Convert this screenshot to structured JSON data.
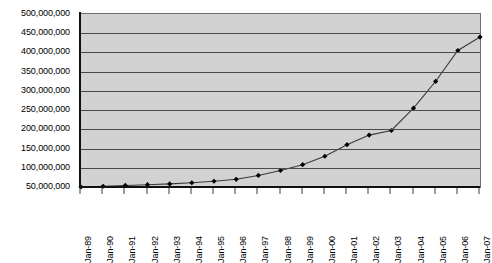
{
  "chart_data": {
    "type": "line",
    "title": "",
    "subtitle": "",
    "xlabel": "",
    "ylabel": "",
    "grid": true,
    "legend": false,
    "legend_position": "none",
    "marker": "diamond",
    "marker_color": "#000000",
    "line_color": "#3a3a3a",
    "plot_background": "#d2d2d2",
    "gridline_color": "#4a4a4a",
    "axis_color": "#111111",
    "ylim": [
      0,
      500000000
    ],
    "y_axis_start": 50000000,
    "ytick_step": 50000000,
    "ytick_labels": [
      "500,000,000",
      "450,000,000",
      "400,000,000",
      "350,000,000",
      "300,000,000",
      "250,000,000",
      "200,000,000",
      "150,000,000",
      "100,000,000",
      "50,000,000"
    ],
    "ytick_values": [
      500000000,
      450000000,
      400000000,
      350000000,
      300000000,
      250000000,
      200000000,
      150000000,
      100000000,
      50000000
    ],
    "categories": [
      "Jan-89",
      "Jan-90",
      "Jan-91",
      "Jan-92",
      "Jan-93",
      "Jan-94",
      "Jan-95",
      "Jan-96",
      "Jan-97",
      "Jan-98",
      "Jan-99",
      "Jan-00",
      "Jan-01",
      "Jan-02",
      "Jan-03",
      "Jan-04",
      "Jan-05",
      "Jan-06",
      "Jan-07"
    ],
    "values": [
      50000000,
      52000000,
      54000000,
      56000000,
      58000000,
      61000000,
      65000000,
      70000000,
      80000000,
      93000000,
      108000000,
      130000000,
      160000000,
      185000000,
      197000000,
      255000000,
      325000000,
      405000000,
      440000000
    ]
  }
}
